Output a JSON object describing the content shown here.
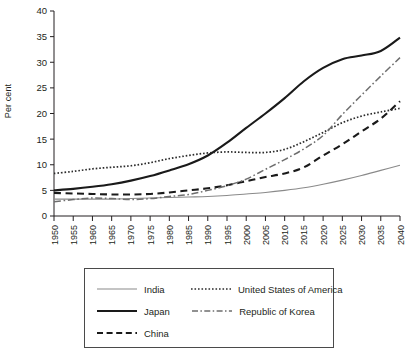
{
  "chart_data": {
    "type": "line",
    "title": "",
    "xlabel": "",
    "ylabel": "Per cent",
    "xlim": [
      1950,
      2040
    ],
    "ylim": [
      0,
      40
    ],
    "ytick_step": 5,
    "grid": false,
    "legend_position": "bottom",
    "x": [
      1950,
      1955,
      1960,
      1965,
      1970,
      1975,
      1980,
      1985,
      1990,
      1995,
      2000,
      2005,
      2010,
      2015,
      2020,
      2025,
      2030,
      2035,
      2040
    ],
    "xtick_labels": [
      "1950",
      "1955",
      "1960",
      "1965",
      "1970",
      "1975",
      "1980",
      "1985",
      "1990",
      "1995",
      "2000",
      "2005",
      "2010",
      "2015",
      "2020",
      "2025",
      "2030",
      "2035",
      "2040"
    ],
    "ytick_labels": [
      "0",
      "5",
      "10",
      "15",
      "20",
      "25",
      "30",
      "35",
      "40"
    ],
    "series": [
      {
        "name": "India",
        "style": "solid-thin",
        "color": "#8a8a8a",
        "values": [
          3.3,
          3.3,
          3.3,
          3.3,
          3.4,
          3.5,
          3.6,
          3.7,
          3.8,
          4.0,
          4.3,
          4.6,
          5.0,
          5.5,
          6.2,
          7.0,
          7.9,
          8.9,
          9.9
        ]
      },
      {
        "name": "Japan",
        "style": "solid-thick",
        "color": "#1a1a1a",
        "values": [
          5.0,
          5.3,
          5.7,
          6.2,
          6.9,
          7.8,
          8.9,
          10.1,
          11.8,
          14.3,
          17.2,
          20.0,
          23.0,
          26.3,
          28.9,
          30.6,
          31.3,
          32.2,
          34.8
        ]
      },
      {
        "name": "China",
        "style": "dashed",
        "color": "#1a1a1a",
        "values": [
          4.5,
          4.4,
          4.3,
          4.2,
          4.2,
          4.3,
          4.6,
          5.0,
          5.4,
          6.0,
          6.8,
          7.6,
          8.3,
          9.5,
          11.8,
          14.0,
          16.5,
          19.0,
          22.4
        ]
      },
      {
        "name": "United States of America",
        "style": "dotted",
        "color": "#2b2b2b",
        "values": [
          8.3,
          8.7,
          9.2,
          9.5,
          9.8,
          10.4,
          11.2,
          11.8,
          12.3,
          12.5,
          12.4,
          12.4,
          13.0,
          14.5,
          16.3,
          18.2,
          19.5,
          20.3,
          21.0
        ]
      },
      {
        "name": "Republic of Korea",
        "style": "dash-dot",
        "color": "#6e6e6e",
        "values": [
          2.8,
          3.2,
          3.5,
          3.4,
          3.2,
          3.4,
          3.8,
          4.2,
          5.0,
          5.9,
          7.2,
          9.1,
          11.0,
          13.1,
          15.7,
          19.8,
          23.6,
          27.3,
          30.9
        ]
      }
    ]
  },
  "legend": {
    "entries": [
      {
        "label": "India",
        "style": "solid-thin"
      },
      {
        "label": "United States of America",
        "style": "dotted"
      },
      {
        "label": "Japan",
        "style": "solid-thick"
      },
      {
        "label": "Republic of Korea",
        "style": "dash-dot"
      },
      {
        "label": "China",
        "style": "dashed"
      }
    ]
  }
}
